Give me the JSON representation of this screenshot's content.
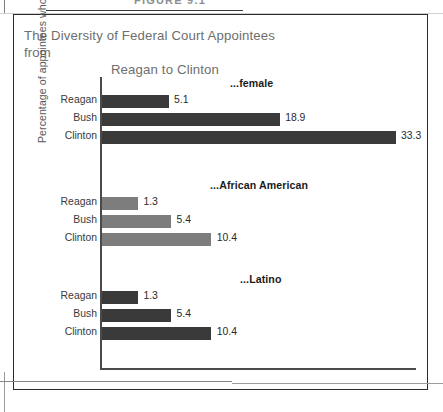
{
  "figure": {
    "caption_label": "FIGURE 9.1",
    "title_line1": "The Diversity of Federal Court Appointees from",
    "title_line2": "Reagan to Clinton",
    "y_axis_title": "Percentage of appointees who are..."
  },
  "colors": {
    "bar_dark": "#3a3a3a",
    "bar_medium": "#7d7d7d",
    "axis": "#4a4a4a",
    "frame": "#2b2b2b",
    "title_text": "#6e6e6e",
    "label_text": "#3a3a3a"
  },
  "chart_data": {
    "type": "bar",
    "orientation": "horizontal",
    "title": "The Diversity of Federal Court Appointees from Reagan to Clinton",
    "xlabel": "",
    "ylabel": "Percentage of appointees who are...",
    "categories": [
      "Reagan",
      "Bush",
      "Clinton"
    ],
    "xlim": [
      0,
      36
    ],
    "grid": false,
    "legend": "none",
    "panels": [
      {
        "name": "...female",
        "color": "#3a3a3a",
        "categories": [
          "Reagan",
          "Bush",
          "Clinton"
        ],
        "values": [
          5.1,
          18.9,
          33.3
        ],
        "value_labels": [
          "5.1",
          "18.9",
          "33.3"
        ]
      },
      {
        "name": "...African American",
        "color": "#7d7d7d",
        "categories": [
          "Reagan",
          "Bush",
          "Clinton"
        ],
        "values": [
          1.3,
          5.4,
          10.4
        ],
        "value_labels": [
          "1.3",
          "5.4",
          "10.4"
        ]
      },
      {
        "name": "...Latino",
        "color": "#3a3a3a",
        "categories": [
          "Reagan",
          "Bush",
          "Clinton"
        ],
        "values": [
          1.3,
          5.4,
          10.4
        ],
        "value_labels": [
          "1.3",
          "5.4",
          "10.4"
        ]
      }
    ]
  },
  "layout": {
    "panel_tops": [
      18,
      120,
      214
    ],
    "header_tops": [
      0,
      102,
      196
    ],
    "header_lefts": [
      130,
      110,
      140
    ],
    "row_step": 18,
    "bar_px_per_unit": 8.05,
    "bar_px_base": 26
  }
}
